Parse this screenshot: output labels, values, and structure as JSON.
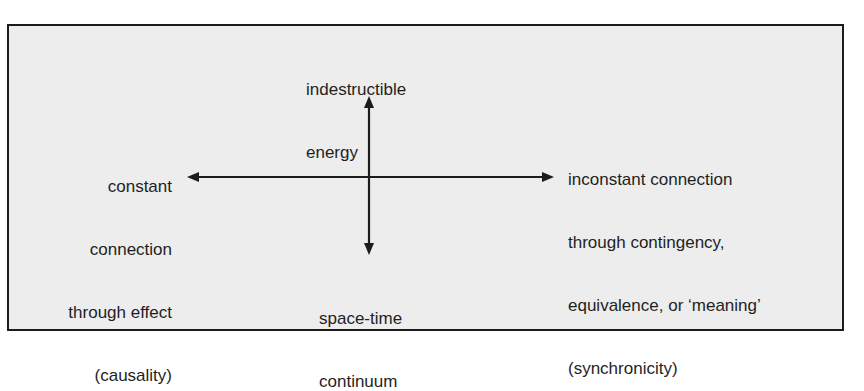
{
  "diagram": {
    "top_label": [
      "indestructible",
      "energy"
    ],
    "bottom_label": [
      "space-time",
      "continuum"
    ],
    "left_label": [
      "constant",
      "connection",
      "through effect",
      "(causality)"
    ],
    "right_label": [
      "inconstant connection",
      "through contingency,",
      "equivalence, or ‘meaning’",
      "(synchronicity)"
    ],
    "colors": {
      "background": "#ededed",
      "border": "#1c1c1c",
      "ink": "#1f1f1f"
    }
  }
}
